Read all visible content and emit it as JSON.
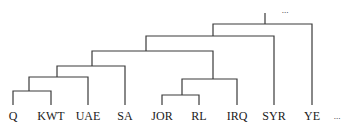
{
  "dendrogram": {
    "leaves": [
      {
        "label": "Q",
        "x": 13
      },
      {
        "label": "KWT",
        "x": 51
      },
      {
        "label": "UAE",
        "x": 88
      },
      {
        "label": "SA",
        "x": 125
      },
      {
        "label": "JOR",
        "x": 162
      },
      {
        "label": "RL",
        "x": 199
      },
      {
        "label": "IRQ",
        "x": 237
      },
      {
        "label": "SYR",
        "x": 274
      },
      {
        "label": "YE",
        "x": 312
      }
    ],
    "trailing_ellipsis": "...",
    "top_ellipsis": "...",
    "merges": [
      {
        "join": [
          "Q",
          "KWT"
        ],
        "y": 91
      },
      {
        "join": [
          "JOR",
          "RL"
        ],
        "y": 95
      },
      {
        "join": [
          "Q,KWT",
          "UAE"
        ],
        "y": 77
      },
      {
        "join": [
          "JOR,RL",
          "IRQ"
        ],
        "y": 79
      },
      {
        "join": [
          "Q,KWT,UAE",
          "SA"
        ],
        "y": 66
      },
      {
        "join": [
          "Gulf",
          "Levant"
        ],
        "y": 51
      },
      {
        "join": [
          "...",
          "SYR"
        ],
        "y": 36
      },
      {
        "join": [
          "...",
          "YE"
        ],
        "y": 24
      }
    ]
  }
}
